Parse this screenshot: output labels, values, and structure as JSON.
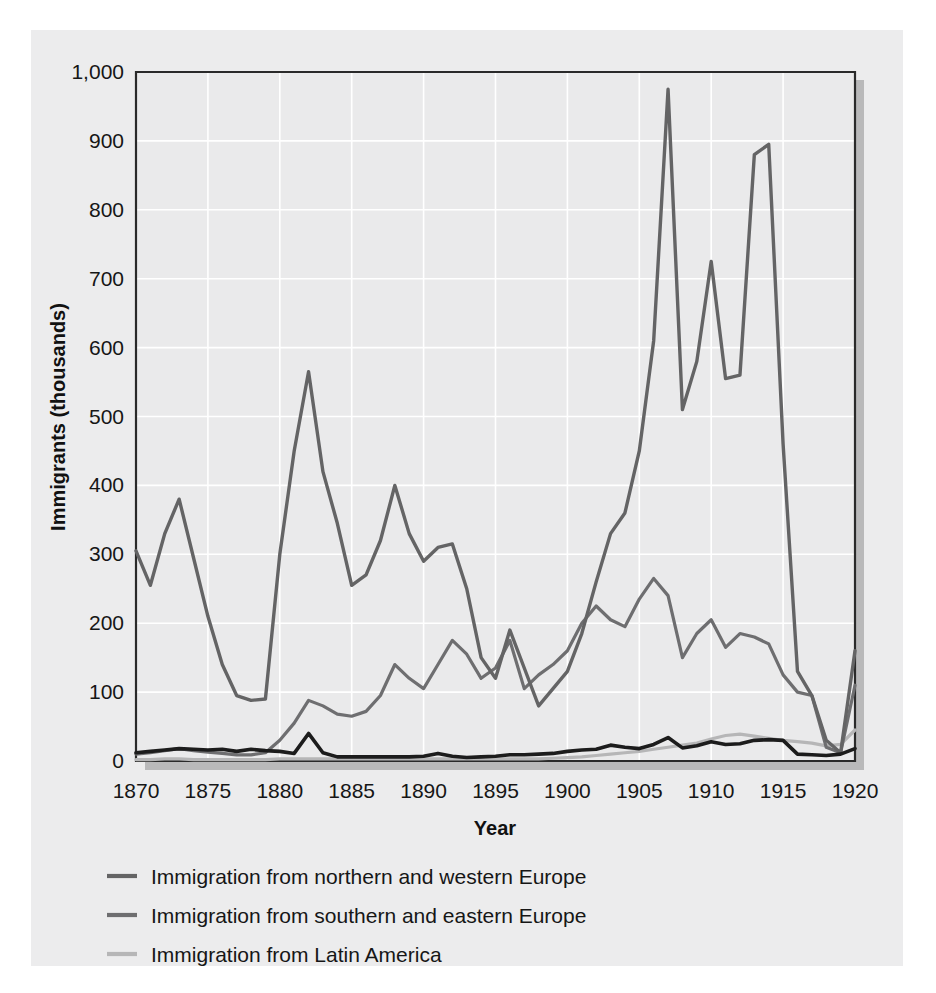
{
  "chart_data": {
    "type": "line",
    "title": "",
    "xlabel": "Year",
    "ylabel": "Immigrants (thousands)",
    "xlim": [
      1870,
      1920
    ],
    "ylim": [
      0,
      1000
    ],
    "grid": true,
    "legend_position": "below-plot-left",
    "x_ticks": [
      "1870",
      "1875",
      "1880",
      "1885",
      "1890",
      "1895",
      "1900",
      "1905",
      "1910",
      "1915",
      "1920"
    ],
    "y_ticks": [
      "0",
      "100",
      "200",
      "300",
      "400",
      "500",
      "600",
      "700",
      "800",
      "900",
      "1,000"
    ],
    "x": [
      1870,
      1871,
      1872,
      1873,
      1874,
      1875,
      1876,
      1877,
      1878,
      1879,
      1880,
      1881,
      1882,
      1883,
      1884,
      1885,
      1886,
      1887,
      1888,
      1889,
      1890,
      1891,
      1892,
      1893,
      1894,
      1895,
      1896,
      1897,
      1898,
      1899,
      1900,
      1901,
      1902,
      1903,
      1904,
      1905,
      1906,
      1907,
      1908,
      1909,
      1910,
      1911,
      1912,
      1913,
      1914,
      1915,
      1916,
      1917,
      1918,
      1919,
      1920
    ],
    "series": [
      {
        "name": "Immigration from northern and western Europe",
        "color": "#646465",
        "values": [
          305,
          255,
          330,
          380,
          295,
          210,
          140,
          95,
          88,
          90,
          300,
          450,
          565,
          420,
          345,
          255,
          270,
          320,
          400,
          330,
          290,
          310,
          315,
          250,
          150,
          120,
          190,
          135,
          80,
          105,
          130,
          185,
          260,
          330,
          360,
          450,
          610,
          975,
          510,
          580,
          725,
          555,
          560,
          880,
          895,
          460,
          130,
          95,
          30,
          12,
          160
        ]
      },
      {
        "name": "Immigration from southern and eastern Europe",
        "color": "#6e6e70",
        "values": [
          10,
          12,
          15,
          18,
          15,
          13,
          11,
          9,
          9,
          12,
          30,
          55,
          88,
          80,
          68,
          65,
          72,
          95,
          140,
          120,
          105,
          140,
          175,
          155,
          120,
          135,
          175,
          105,
          125,
          140,
          160,
          200,
          225,
          205,
          195,
          235,
          265,
          240,
          150,
          185,
          205,
          165,
          185,
          180,
          170,
          125,
          100,
          95,
          20,
          12,
          110
        ]
      },
      {
        "name": "Immigration from Latin America",
        "color": "#b6b6b7",
        "values": [
          2,
          2,
          3,
          3,
          2,
          2,
          2,
          2,
          2,
          2,
          3,
          3,
          3,
          3,
          3,
          3,
          3,
          3,
          3,
          3,
          3,
          3,
          3,
          3,
          3,
          3,
          3,
          3,
          3,
          4,
          5,
          6,
          8,
          10,
          12,
          14,
          17,
          20,
          23,
          26,
          32,
          37,
          39,
          36,
          33,
          30,
          28,
          26,
          22,
          24,
          45
        ]
      },
      {
        "name": "Immigration from Asia",
        "color": "#1c1c1c",
        "values": [
          12,
          14,
          16,
          18,
          17,
          16,
          17,
          14,
          17,
          15,
          14,
          11,
          40,
          12,
          6,
          6,
          6,
          6,
          6,
          6,
          7,
          11,
          7,
          5,
          6,
          7,
          9,
          9,
          10,
          11,
          14,
          16,
          17,
          23,
          20,
          18,
          24,
          34,
          19,
          22,
          28,
          24,
          25,
          30,
          31,
          30,
          10,
          9,
          8,
          10,
          18
        ]
      }
    ]
  },
  "legend": {
    "items": [
      {
        "label": "Immigration from northern and western Europe",
        "color": "#646465"
      },
      {
        "label": "Immigration from southern and eastern Europe",
        "color": "#6e6e70"
      },
      {
        "label": "Immigration from Latin America",
        "color": "#b6b6b7"
      },
      {
        "label": "Immigration from Asia",
        "color": "#1c1c1c"
      }
    ]
  }
}
